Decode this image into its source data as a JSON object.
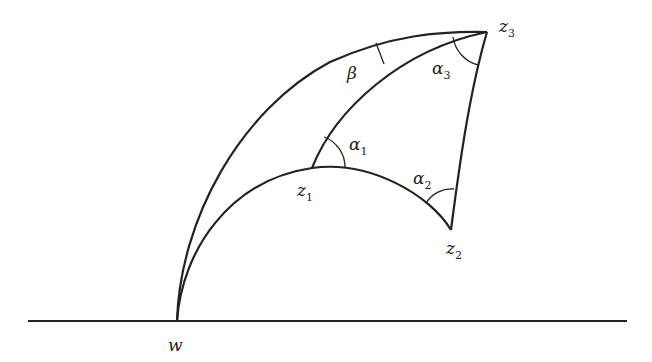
{
  "diagram": {
    "type": "hyperbolic-triangle",
    "baseline": {
      "x1": 28,
      "x2": 627,
      "y": 321
    },
    "points": {
      "w": {
        "x": 177,
        "y": 321
      },
      "z1": {
        "x": 312,
        "y": 168
      },
      "z2": {
        "x": 451,
        "y": 230
      },
      "z3": {
        "x": 487,
        "y": 32
      }
    },
    "labels": {
      "w": {
        "base": "w",
        "sub": ""
      },
      "z1": {
        "base": "z",
        "sub": "1"
      },
      "z2": {
        "base": "z",
        "sub": "2"
      },
      "z3": {
        "base": "z",
        "sub": "3"
      },
      "alpha1": {
        "base": "α",
        "sub": "1"
      },
      "alpha2": {
        "base": "α",
        "sub": "2"
      },
      "alpha3": {
        "base": "α",
        "sub": "3"
      },
      "beta": {
        "base": "β",
        "sub": ""
      }
    },
    "stroke_color": "#222222"
  }
}
